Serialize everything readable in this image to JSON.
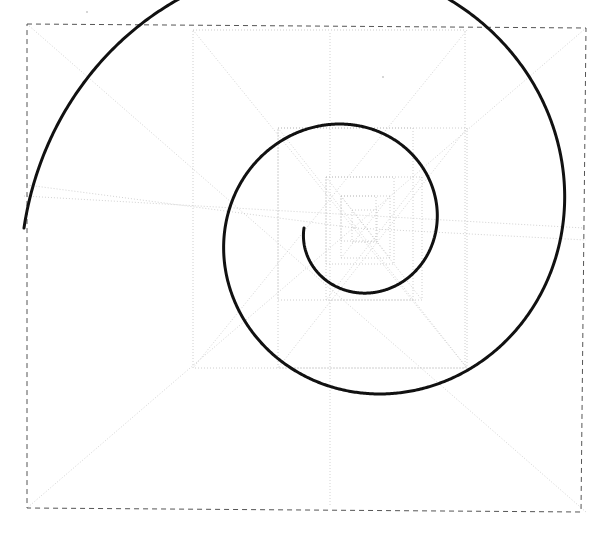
{
  "figure": {
    "background_color": "#ffffff",
    "canvas": {
      "width": 605,
      "height": 537
    }
  },
  "chart_data": {
    "type": "scatter",
    "subtitle": "",
    "xlabel": "",
    "ylabel": "",
    "xlim": [
      0,
      605
    ],
    "ylim": [
      0,
      537
    ],
    "grid": false,
    "legend_position": "none",
    "annotations": [],
    "tick_labels": {
      "x": [],
      "y": []
    },
    "series": [
      {
        "name": "spiral",
        "kind": "logarithmic-spiral",
        "stroke_color": "#111111",
        "stroke_width": 3.0,
        "center": [
          355,
          228
        ],
        "start_radius": 331,
        "end_radius": 51,
        "start_angle_deg": 180,
        "turns": 2.0,
        "direction": "clockwise-inward",
        "endpoint_outer": [
          24,
          196
        ],
        "endpoint_inner": [
          406,
          232
        ],
        "tangent_bottom": [
          330,
          507
        ],
        "tangent_right": [
          584,
          228
        ],
        "tangent_top": [
          330,
          33
        ]
      },
      {
        "name": "bounding-rectangle",
        "kind": "dashed-rect",
        "stroke_color": "#555555",
        "stroke_width": 1.0,
        "dash": "5 4",
        "corners": [
          [
            27,
            24
          ],
          [
            586,
            28
          ],
          [
            581,
            512
          ],
          [
            27,
            508
          ]
        ]
      },
      {
        "name": "construction-squares",
        "kind": "dotted-nested-squares",
        "stroke_color": "#c2c2c2",
        "stroke_width": 0.8,
        "dash": "1 2",
        "rects": [
          [
            193,
            30,
            272,
            338
          ],
          [
            278,
            128,
            189,
            240
          ],
          [
            278,
            128,
            135,
            172
          ],
          [
            326,
            177,
            96,
            123
          ],
          [
            326,
            177,
            68,
            87
          ],
          [
            341,
            196,
            49,
            62
          ],
          [
            341,
            196,
            35,
            45
          ],
          [
            352,
            210,
            25,
            32
          ]
        ]
      },
      {
        "name": "construction-diagonals",
        "kind": "dotted-lines",
        "stroke_color": "#c6c6c6",
        "stroke_width": 0.8,
        "dash": "1 2",
        "lines": [
          [
            27,
            24,
            586,
            512
          ],
          [
            586,
            28,
            27,
            508
          ],
          [
            24,
            196,
            584,
            228
          ],
          [
            330,
            33,
            330,
            507
          ],
          [
            193,
            30,
            467,
            368
          ],
          [
            467,
            30,
            193,
            368
          ],
          [
            278,
            128,
            467,
            368
          ],
          [
            467,
            128,
            278,
            368
          ],
          [
            326,
            177,
            422,
            300
          ],
          [
            422,
            177,
            326,
            300
          ],
          [
            341,
            196,
            390,
            258
          ],
          [
            390,
            196,
            341,
            258
          ],
          [
            355,
            228,
            27,
            185
          ],
          [
            355,
            228,
            586,
            240
          ]
        ]
      }
    ]
  },
  "markings": {
    "speck_label": "ink-speck",
    "specks": [
      {
        "x": 86,
        "y": 11
      },
      {
        "x": 382,
        "y": 76
      }
    ]
  }
}
